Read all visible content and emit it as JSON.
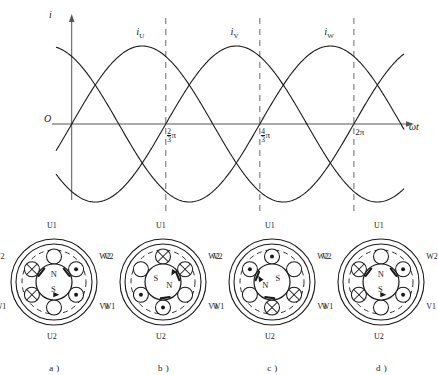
{
  "figure": {
    "line_color": "#1a1a1a",
    "axis_color": "#555555",
    "dash_color": "#777777",
    "background": "#ffffff"
  },
  "chart_data": {
    "type": "line",
    "title": "",
    "xlabel": "ωt",
    "ylabel": "i",
    "xlim": [
      -0.35,
      7.4
    ],
    "ylim": [
      -1.35,
      1.35
    ],
    "grid": false,
    "legend": "inline-labels",
    "origin_label": "O",
    "x_ticks": [
      {
        "value": 2.0944,
        "label": "2/3π",
        "numerator": "2",
        "denominator": "3",
        "symbol": "π"
      },
      {
        "value": 4.1888,
        "label": "4/3π",
        "numerator": "4",
        "denominator": "3",
        "symbol": "π"
      },
      {
        "value": 6.2832,
        "label": "2π",
        "numerator": "",
        "denominator": "",
        "symbol": "2π"
      }
    ],
    "dashed_verticals": [
      2.0944,
      4.1888,
      6.2832
    ],
    "series": [
      {
        "name": "i_U",
        "label": "i",
        "subscript": "U",
        "phase_deg": 0,
        "amplitude": 1,
        "label_x": 1.57,
        "label_y": 1.18
      },
      {
        "name": "i_V",
        "label": "i",
        "subscript": "V",
        "phase_deg": -120,
        "amplitude": 1,
        "label_x": 3.67,
        "label_y": 1.18
      },
      {
        "name": "i_W",
        "label": "i",
        "subscript": "W",
        "phase_deg": -240,
        "amplitude": 1,
        "label_x": 5.76,
        "label_y": 1.18
      }
    ]
  },
  "motors": [
    {
      "caption": "a )",
      "field_angle_deg": 0,
      "north_label": "N",
      "south_label": "S",
      "terminals": {
        "top": "U1",
        "bottom": "U2",
        "upper_left": "V2",
        "lower_left": "W1",
        "upper_right": "W2",
        "lower_right": "V1"
      },
      "slots": [
        {
          "position": "top",
          "symbol": "empty"
        },
        {
          "position": "upper_right",
          "symbol": "dot"
        },
        {
          "position": "lower_right",
          "symbol": "dot"
        },
        {
          "position": "bottom",
          "symbol": "empty"
        },
        {
          "position": "lower_left",
          "symbol": "cross"
        },
        {
          "position": "upper_left",
          "symbol": "cross"
        }
      ]
    },
    {
      "caption": "b )",
      "field_angle_deg": 120,
      "north_label": "N",
      "south_label": "S",
      "terminals": {
        "top": "U1",
        "bottom": "U2",
        "upper_left": "V2",
        "lower_left": "W1",
        "upper_right": "W2",
        "lower_right": "V1"
      },
      "slots": [
        {
          "position": "top",
          "symbol": "cross"
        },
        {
          "position": "upper_right",
          "symbol": "cross"
        },
        {
          "position": "lower_right",
          "symbol": "empty"
        },
        {
          "position": "bottom",
          "symbol": "dot"
        },
        {
          "position": "lower_left",
          "symbol": "dot"
        },
        {
          "position": "upper_left",
          "symbol": "empty"
        }
      ]
    },
    {
      "caption": "c )",
      "field_angle_deg": 240,
      "north_label": "N",
      "south_label": "S",
      "terminals": {
        "top": "U1",
        "bottom": "U2",
        "upper_left": "V2",
        "lower_left": "W1",
        "upper_right": "W2",
        "lower_right": "V1"
      },
      "slots": [
        {
          "position": "top",
          "symbol": "dot"
        },
        {
          "position": "upper_right",
          "symbol": "empty"
        },
        {
          "position": "lower_right",
          "symbol": "cross"
        },
        {
          "position": "bottom",
          "symbol": "cross"
        },
        {
          "position": "lower_left",
          "symbol": "empty"
        },
        {
          "position": "upper_left",
          "symbol": "dot"
        }
      ]
    },
    {
      "caption": "d )",
      "field_angle_deg": 360,
      "north_label": "N",
      "south_label": "S",
      "terminals": {
        "top": "U1",
        "bottom": "U2",
        "upper_left": "V2",
        "lower_left": "W1",
        "upper_right": "W2",
        "lower_right": "V1"
      },
      "slots": [
        {
          "position": "top",
          "symbol": "empty"
        },
        {
          "position": "upper_right",
          "symbol": "dot"
        },
        {
          "position": "lower_right",
          "symbol": "dot"
        },
        {
          "position": "bottom",
          "symbol": "empty"
        },
        {
          "position": "lower_left",
          "symbol": "cross"
        },
        {
          "position": "upper_left",
          "symbol": "cross"
        }
      ]
    }
  ]
}
